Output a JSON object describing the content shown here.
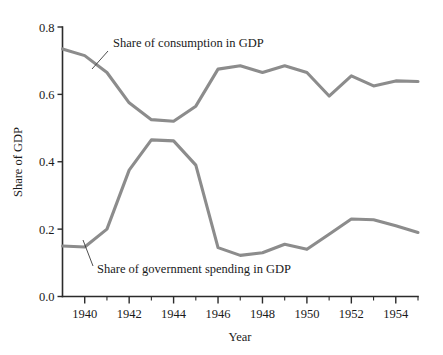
{
  "chart_data": {
    "type": "line",
    "title": "",
    "subtitle": "",
    "xlabel": "Year",
    "ylabel": "Share of GDP",
    "xlim": [
      1939,
      1955
    ],
    "ylim": [
      0.0,
      0.8
    ],
    "grid": false,
    "legend_position": "inline-annotations",
    "x": [
      1939,
      1940,
      1941,
      1942,
      1943,
      1944,
      1945,
      1946,
      1947,
      1948,
      1949,
      1950,
      1951,
      1952,
      1953,
      1954,
      1955
    ],
    "x_tick_labels_major": [
      "1940",
      "1942",
      "1944",
      "1946",
      "1948",
      "1950",
      "1952",
      "1954"
    ],
    "x_ticks_major": [
      1940,
      1942,
      1944,
      1946,
      1948,
      1950,
      1952,
      1954
    ],
    "x_ticks_minor": [
      1939,
      1941,
      1943,
      1945,
      1947,
      1949,
      1951,
      1953,
      1955
    ],
    "y_tick_labels": [
      "0.0",
      "0.2",
      "0.4",
      "0.6",
      "0.8"
    ],
    "y_ticks": [
      0.0,
      0.2,
      0.4,
      0.6,
      0.8
    ],
    "series": [
      {
        "name": "Share of consumption in GDP",
        "color": "#8c8c8c",
        "values": [
          0.735,
          0.715,
          0.665,
          0.575,
          0.525,
          0.52,
          0.565,
          0.675,
          0.685,
          0.665,
          0.685,
          0.665,
          0.595,
          0.655,
          0.625,
          0.64,
          0.638
        ]
      },
      {
        "name": "Share of government spending in GDP",
        "color": "#8c8c8c",
        "values": [
          0.15,
          0.147,
          0.2,
          0.375,
          0.465,
          0.462,
          0.39,
          0.145,
          0.122,
          0.13,
          0.155,
          0.14,
          0.185,
          0.23,
          0.228,
          0.21,
          0.19
        ]
      }
    ],
    "annotations": [
      {
        "label": "Share of consumption in GDP",
        "text_x": 113,
        "text_y": 47,
        "leader_from_x": 108,
        "leader_from_y": 51,
        "leader_to_x": 92,
        "leader_to_y": 69
      },
      {
        "label": "Share of government spending in GDP",
        "text_x": 97,
        "text_y": 273,
        "leader_from_x": 93,
        "leader_from_y": 266,
        "leader_to_x": 83,
        "leader_to_y": 240
      }
    ]
  },
  "axes": {
    "x_axis_label": "Year",
    "y_axis_label": "Share of GDP"
  }
}
